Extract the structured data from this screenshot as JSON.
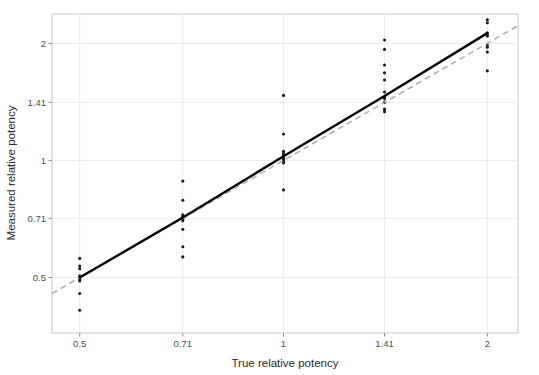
{
  "chart_data": {
    "type": "scatter",
    "title": "",
    "xlabel": "True relative potency",
    "ylabel": "Measured relative potency",
    "x_scale": "log",
    "y_scale": "log",
    "xticks": [
      "0.5",
      "0.71",
      "1",
      "1.41",
      "2"
    ],
    "xtick_values": [
      0.5,
      0.71,
      1,
      1.41,
      2
    ],
    "yticks": [
      "0.5",
      "0.71",
      "1",
      "1.41",
      "2"
    ],
    "ytick_values": [
      0.5,
      0.71,
      1,
      1.41,
      2
    ],
    "xlim": [
      0.455,
      2.22
    ],
    "ylim": [
      0.36,
      2.38
    ],
    "grid": true,
    "legend": "none",
    "point_color": "#1a1a1a",
    "fit_line_color": "#000000",
    "identity_line_color": "#b0b0b0",
    "panel_background": "#ffffff",
    "grid_color": "#ebebeb",
    "series": [
      {
        "name": "measurements",
        "marker": "point",
        "points": [
          {
            "x": 0.5,
            "y": 0.56
          },
          {
            "x": 0.5,
            "y": 0.535
          },
          {
            "x": 0.5,
            "y": 0.527
          },
          {
            "x": 0.5,
            "y": 0.505
          },
          {
            "x": 0.5,
            "y": 0.5
          },
          {
            "x": 0.5,
            "y": 0.497
          },
          {
            "x": 0.5,
            "y": 0.493
          },
          {
            "x": 0.5,
            "y": 0.49
          },
          {
            "x": 0.5,
            "y": 0.455
          },
          {
            "x": 0.5,
            "y": 0.412
          },
          {
            "x": 0.71,
            "y": 0.885
          },
          {
            "x": 0.71,
            "y": 0.79
          },
          {
            "x": 0.71,
            "y": 0.725
          },
          {
            "x": 0.71,
            "y": 0.718
          },
          {
            "x": 0.71,
            "y": 0.712
          },
          {
            "x": 0.71,
            "y": 0.707
          },
          {
            "x": 0.71,
            "y": 0.7
          },
          {
            "x": 0.71,
            "y": 0.665
          },
          {
            "x": 0.71,
            "y": 0.6
          },
          {
            "x": 0.71,
            "y": 0.565
          },
          {
            "x": 1.0,
            "y": 1.47
          },
          {
            "x": 1.0,
            "y": 1.17
          },
          {
            "x": 1.0,
            "y": 1.055
          },
          {
            "x": 1.0,
            "y": 1.04
          },
          {
            "x": 1.0,
            "y": 1.03
          },
          {
            "x": 1.0,
            "y": 1.02
          },
          {
            "x": 1.0,
            "y": 1.015
          },
          {
            "x": 1.0,
            "y": 1.005
          },
          {
            "x": 1.0,
            "y": 0.995
          },
          {
            "x": 1.0,
            "y": 0.985
          },
          {
            "x": 1.0,
            "y": 0.84
          },
          {
            "x": 1.41,
            "y": 2.04
          },
          {
            "x": 1.41,
            "y": 1.93
          },
          {
            "x": 1.41,
            "y": 1.76
          },
          {
            "x": 1.41,
            "y": 1.68
          },
          {
            "x": 1.41,
            "y": 1.61
          },
          {
            "x": 1.41,
            "y": 1.5
          },
          {
            "x": 1.41,
            "y": 1.455
          },
          {
            "x": 1.41,
            "y": 1.44
          },
          {
            "x": 1.41,
            "y": 1.41
          },
          {
            "x": 1.41,
            "y": 1.355
          },
          {
            "x": 1.41,
            "y": 1.335
          },
          {
            "x": 2.0,
            "y": 2.3
          },
          {
            "x": 2.0,
            "y": 2.26
          },
          {
            "x": 2.0,
            "y": 2.13
          },
          {
            "x": 2.0,
            "y": 2.1
          },
          {
            "x": 2.0,
            "y": 2.09
          },
          {
            "x": 2.0,
            "y": 1.98
          },
          {
            "x": 2.0,
            "y": 1.955
          },
          {
            "x": 2.0,
            "y": 1.9
          },
          {
            "x": 2.0,
            "y": 1.7
          }
        ]
      }
    ],
    "fit_line": {
      "name": "fitted-trend",
      "style": "solid",
      "points": [
        {
          "x": 0.5,
          "y": 0.5
        },
        {
          "x": 0.71,
          "y": 0.713
        },
        {
          "x": 1.0,
          "y": 1.025
        },
        {
          "x": 1.41,
          "y": 1.465
        },
        {
          "x": 2.0,
          "y": 2.125
        }
      ]
    },
    "identity_line": {
      "name": "identity-reference",
      "style": "dashed",
      "points": [
        {
          "x": 0.455,
          "y": 0.455
        },
        {
          "x": 2.22,
          "y": 2.22
        }
      ]
    }
  }
}
